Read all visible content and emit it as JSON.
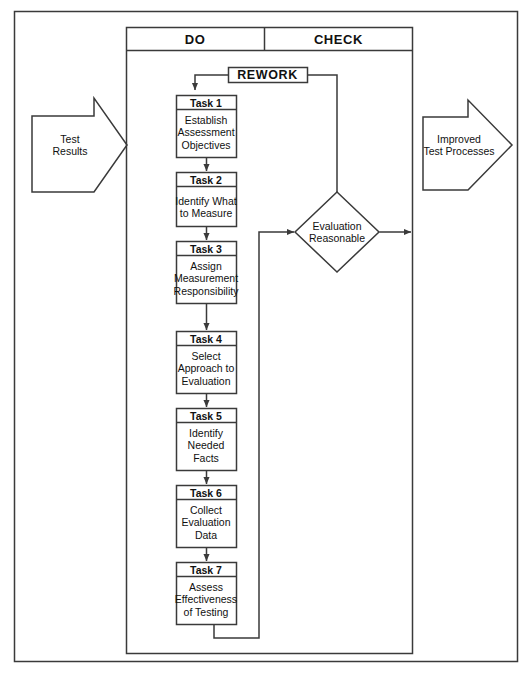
{
  "diagram": {
    "title_ghost": "",
    "phases": [
      {
        "id": "do",
        "label": "DO"
      },
      {
        "id": "check",
        "label": "CHECK"
      }
    ],
    "rework": {
      "label": "REWORK"
    },
    "inputs": [
      {
        "id": "test-results",
        "label": "Test\nResults"
      }
    ],
    "outputs": [
      {
        "id": "improved-test-processes",
        "label": "Improved\nTest Processes"
      }
    ],
    "decision": {
      "id": "evaluation-reasonable",
      "label": "Evaluation\nReasonable"
    },
    "tasks": [
      {
        "id": "task-1",
        "number": "Task 1",
        "label": "Establish\nAssessment\nObjectives"
      },
      {
        "id": "task-2",
        "number": "Task 2",
        "label": "Identify What\nto Measure"
      },
      {
        "id": "task-3",
        "number": "Task 3",
        "label": "Assign\nMeasurement\nResponsibility"
      },
      {
        "id": "task-4",
        "number": "Task 4",
        "label": "Select\nApproach to\nEvaluation"
      },
      {
        "id": "task-5",
        "number": "Task 5",
        "label": "Identify\nNeeded\nFacts"
      },
      {
        "id": "task-6",
        "number": "Task 6",
        "label": "Collect\nEvaluation\nData"
      },
      {
        "id": "task-7",
        "number": "Task 7",
        "label": "Assess\nEffectiveness\nof Testing"
      }
    ],
    "colors": {
      "stroke": "#3a3a3a",
      "background": "#ffffff",
      "text": "#111111"
    }
  }
}
